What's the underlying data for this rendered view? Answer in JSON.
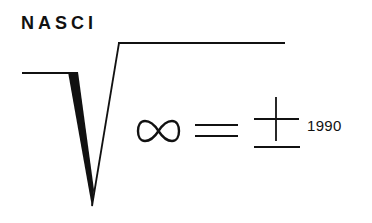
{
  "logo": {
    "title": "NASCI",
    "year": "1990",
    "symbols": [
      "radical-sign",
      "infinity",
      "equals",
      "plus-minus"
    ],
    "ink_color": "#111111",
    "background": "#ffffff"
  }
}
